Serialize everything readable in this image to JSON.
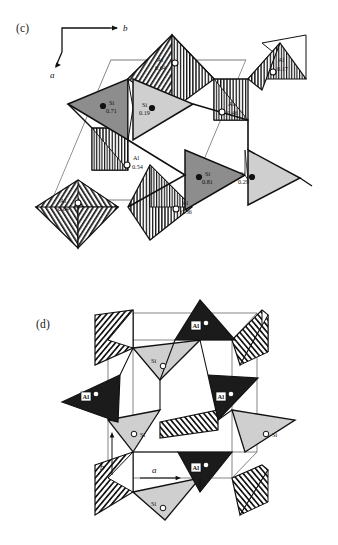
{
  "figure": {
    "panels": [
      {
        "id": "c",
        "label": "(c)",
        "axes": [
          {
            "name": "b",
            "label": "b",
            "direction": "right"
          },
          {
            "name": "a",
            "label": "a",
            "direction": "down-left"
          }
        ],
        "atoms": [
          {
            "id": "si-071",
            "element": "Si",
            "value": "0.71",
            "marker": "filled-circle",
            "tetra_shade": "dark-gray"
          },
          {
            "id": "si-019",
            "element": "Si",
            "value": "0.19",
            "marker": "filled-circle",
            "tetra_shade": "light-gray"
          },
          {
            "id": "si-081",
            "element": "Si",
            "value": "0.81",
            "marker": "filled-circle",
            "tetra_shade": "dark-gray"
          },
          {
            "id": "si-029",
            "element": "Si",
            "value": "0.29",
            "marker": "filled-circle",
            "tetra_shade": "light-gray"
          },
          {
            "id": "al-064",
            "element": "Al",
            "value": "0.64",
            "marker": "open-circle",
            "tetra_shade": "hatched"
          },
          {
            "id": "al-017",
            "element": "Al",
            "value": "0.17",
            "marker": "open-circle",
            "tetra_shade": "hatched"
          },
          {
            "id": "al-046",
            "element": "Al",
            "value": "0.46",
            "marker": "open-circle",
            "tetra_shade": "hatched"
          },
          {
            "id": "al-054",
            "element": "Al",
            "value": "0.54",
            "marker": "open-circle",
            "tetra_shade": "hatched"
          },
          {
            "id": "al-036",
            "element": "Al",
            "value": "0.36",
            "marker": "open-circle",
            "tetra_shade": "hatched"
          },
          {
            "id": "al-084",
            "element": "Al",
            "value": "0.84",
            "marker": "open-circle",
            "tetra_shade": "hatched"
          }
        ]
      },
      {
        "id": "d",
        "label": "(d)",
        "axes": [
          {
            "name": "b",
            "label": "b",
            "direction": "up"
          },
          {
            "name": "a",
            "label": "a",
            "direction": "right"
          }
        ],
        "atoms": [
          {
            "id": "d-al-1",
            "element": "Al",
            "marker": "white-dot",
            "tetra_shade": "black"
          },
          {
            "id": "d-al-2",
            "element": "Al",
            "marker": "white-dot",
            "tetra_shade": "black"
          },
          {
            "id": "d-al-3",
            "element": "Al",
            "marker": "white-dot",
            "tetra_shade": "black"
          },
          {
            "id": "d-al-4",
            "element": "Al",
            "marker": "white-dot",
            "tetra_shade": "black"
          },
          {
            "id": "d-si-1",
            "element": "Si",
            "marker": "open-circle",
            "tetra_shade": "light-gray"
          },
          {
            "id": "d-si-2",
            "element": "Si",
            "marker": "open-circle",
            "tetra_shade": "light-gray"
          },
          {
            "id": "d-si-3",
            "element": "Si",
            "marker": "open-circle",
            "tetra_shade": "light-gray"
          },
          {
            "id": "d-si-4",
            "element": "Si",
            "marker": "open-circle",
            "tetra_shade": "light-gray"
          }
        ]
      }
    ],
    "colors": {
      "outline": "#111111",
      "cell_edge": "#6b6b6b",
      "dark_gray_tetra": "#8f8f8f",
      "light_gray_tetra": "#cfcfcf",
      "black_tetra": "#1b1b1b",
      "background": "#ffffff"
    }
  }
}
